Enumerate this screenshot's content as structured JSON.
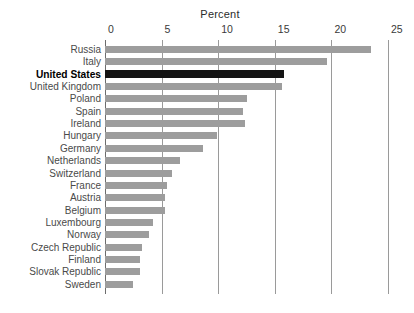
{
  "chart_data": {
    "type": "bar",
    "orientation": "horizontal",
    "title": "Percent",
    "xlabel": "Percent",
    "ylabel": "",
    "xlim": [
      0,
      25
    ],
    "xticks": [
      0,
      5,
      10,
      15,
      20,
      25
    ],
    "xtick_labels": [
      "0",
      "5",
      "10",
      "15",
      "20",
      "25"
    ],
    "grid": true,
    "legend": "none",
    "highlight_category": "United States",
    "colors": {
      "bar": "#9d9d9d",
      "highlight_bar": "#141414",
      "gridline": "#9a9a9a",
      "axis": "#6d6d6d",
      "text": "#4a4a4a",
      "background": "#ffffff"
    },
    "categories": [
      "Russia",
      "Italy",
      "United States",
      "United Kingdom",
      "Poland",
      "Spain",
      "Ireland",
      "Hungary",
      "Germany",
      "Netherlands",
      "Switzerland",
      "France",
      "Austria",
      "Belgium",
      "Luxembourg",
      "Norway",
      "Czech Republic",
      "Finland",
      "Slovak Republic",
      "Sweden"
    ],
    "values": [
      23.5,
      19.6,
      15.8,
      15.6,
      12.5,
      12.2,
      12.4,
      9.9,
      8.7,
      6.6,
      5.9,
      5.5,
      5.3,
      5.3,
      4.2,
      3.9,
      3.3,
      3.1,
      3.1,
      2.5
    ]
  }
}
